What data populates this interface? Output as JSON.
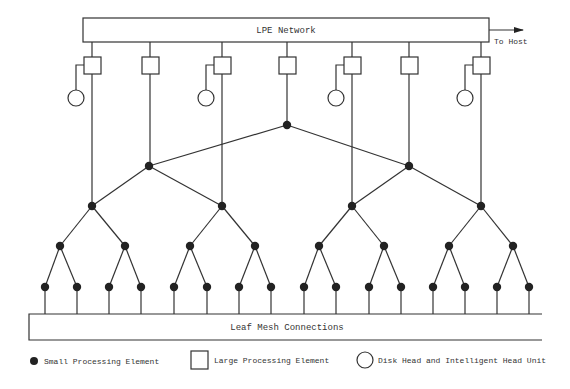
{
  "diagram": {
    "lpe_network": {
      "label": "LPE Network",
      "output_label": "To Host"
    },
    "leaf_mesh": {
      "label": "Leaf Mesh Connections"
    },
    "colors": {
      "line": "#333333",
      "node_fill": "#222222",
      "background": "#ffffff"
    }
  },
  "large_processing_elements": [
    {
      "x": 92,
      "has_disk": true
    },
    {
      "x": 150,
      "has_disk": false
    },
    {
      "x": 222,
      "has_disk": true
    },
    {
      "x": 287,
      "has_disk": false
    },
    {
      "x": 352,
      "has_disk": true
    },
    {
      "x": 409,
      "has_disk": false
    },
    {
      "x": 481,
      "has_disk": true
    }
  ],
  "tree": {
    "levels": 5,
    "level_y": [
      125,
      166,
      206,
      246,
      287
    ],
    "root_x": 287,
    "level1_x": [
      149,
      409
    ],
    "level2_x": [
      92,
      222,
      352,
      481
    ],
    "level3_x": [
      60,
      125,
      190,
      255,
      319,
      384,
      449,
      513
    ],
    "level4_x": [
      45,
      77,
      109,
      141,
      174,
      207,
      239,
      271,
      304,
      336,
      369,
      401,
      433,
      465,
      497,
      529
    ]
  },
  "legend": {
    "items": [
      {
        "symbol": "filled-circle",
        "label": "Small Processing Element"
      },
      {
        "symbol": "square",
        "label": "Large Processing Element"
      },
      {
        "symbol": "circle",
        "label": "Disk Head and Intelligent Head Unit"
      }
    ]
  }
}
